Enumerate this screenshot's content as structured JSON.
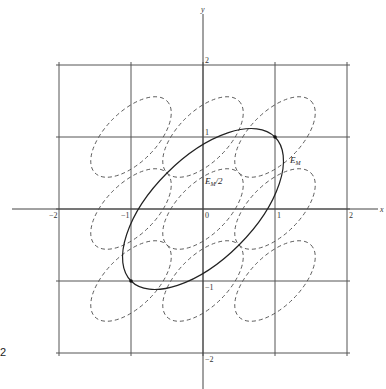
{
  "figure": {
    "origin_px": [
      203,
      209
    ],
    "unit_px": 72,
    "axes": {
      "x_label": "x",
      "y_label": "y",
      "x_ticks": [
        {
          "value": -2,
          "label": "−2"
        },
        {
          "value": -1,
          "label": "−1"
        },
        {
          "value": 0,
          "label": "0"
        },
        {
          "value": 1,
          "label": "1"
        },
        {
          "value": 2,
          "label": "2"
        }
      ],
      "y_ticks": [
        {
          "value": 2,
          "label": "2"
        },
        {
          "value": 1,
          "label": "1"
        },
        {
          "value": -1,
          "label": "−1"
        },
        {
          "value": -2,
          "label": "−2"
        }
      ]
    },
    "grid": {
      "x": [
        -2,
        -1,
        0,
        1,
        2
      ],
      "y": [
        -2,
        -1,
        0,
        1,
        2
      ]
    },
    "solid_ellipse": {
      "name": "E",
      "subscript": "M",
      "center": [
        0,
        0
      ],
      "semi_major": 1.414,
      "semi_minor": 0.707,
      "rotation_deg": 45
    },
    "dashed_ellipse_label": {
      "name": "E",
      "subscript": "M",
      "suffix": "/2"
    },
    "dashed_ellipses": {
      "semi_major": 0.707,
      "semi_minor": 0.354,
      "rotation_deg": 45,
      "centers": [
        [
          -1,
          1
        ],
        [
          0,
          1
        ],
        [
          1,
          1
        ],
        [
          -1,
          0
        ],
        [
          0,
          0
        ],
        [
          1,
          0
        ],
        [
          -1,
          -1
        ],
        [
          0,
          -1
        ],
        [
          1,
          -1
        ]
      ]
    },
    "marked_points": [
      [
        1,
        1
      ],
      [
        -1,
        -1
      ]
    ],
    "side_label": "2"
  }
}
